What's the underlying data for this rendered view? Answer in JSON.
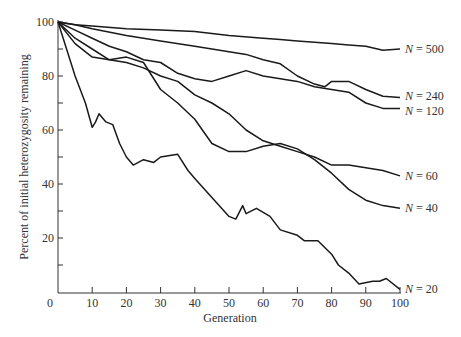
{
  "chart_data": {
    "type": "line",
    "title": "",
    "xlabel": "Generation",
    "ylabel": "Percent of initial heterozygosity remaining",
    "xlim": [
      0,
      100
    ],
    "ylim": [
      0,
      100
    ],
    "x_ticks": [
      0,
      10,
      20,
      30,
      40,
      50,
      60,
      70,
      80,
      90,
      100
    ],
    "y_ticks": [
      20,
      40,
      60,
      80,
      100
    ],
    "y_minor_ticks": [
      10,
      30,
      50,
      70,
      90
    ],
    "grid": false,
    "legend_position": "inline-right",
    "series": [
      {
        "name": "N = 500",
        "label": "N = 500",
        "x": [
          0,
          5,
          10,
          20,
          30,
          40,
          50,
          60,
          65,
          70,
          80,
          85,
          90,
          95,
          100
        ],
        "values": [
          100,
          99,
          98.5,
          97.5,
          97,
          96.5,
          95,
          94,
          93.5,
          93,
          92,
          91.5,
          91,
          89.5,
          90
        ]
      },
      {
        "name": "N = 240",
        "label": "N = 240",
        "x": [
          0,
          5,
          10,
          20,
          30,
          40,
          45,
          50,
          55,
          60,
          65,
          70,
          75,
          78,
          80,
          85,
          90,
          95,
          100
        ],
        "values": [
          100,
          99,
          97.5,
          95,
          93,
          91,
          90,
          89,
          88,
          86,
          84.5,
          80,
          77,
          76,
          78,
          78,
          75,
          72.5,
          72
        ]
      },
      {
        "name": "N = 120",
        "label": "N = 120",
        "x": [
          0,
          5,
          10,
          15,
          20,
          25,
          30,
          35,
          40,
          45,
          50,
          55,
          60,
          65,
          70,
          75,
          80,
          85,
          90,
          95,
          100
        ],
        "values": [
          100,
          97,
          94,
          91,
          89,
          86,
          85,
          81,
          79,
          78,
          80,
          82,
          80,
          79,
          78,
          76,
          75,
          74,
          70,
          68,
          68
        ]
      },
      {
        "name": "N = 60",
        "label": "N = 60",
        "x": [
          0,
          5,
          10,
          15,
          20,
          25,
          30,
          35,
          40,
          45,
          50,
          55,
          60,
          65,
          70,
          75,
          80,
          85,
          90,
          95,
          100
        ],
        "values": [
          100,
          92,
          87,
          86,
          85,
          83,
          80,
          78,
          73,
          70,
          66,
          60,
          56,
          54,
          52,
          50,
          47,
          47,
          46,
          45,
          43
        ]
      },
      {
        "name": "N = 40",
        "label": "N = 40",
        "x": [
          0,
          5,
          10,
          15,
          20,
          25,
          30,
          35,
          40,
          45,
          50,
          55,
          60,
          65,
          70,
          75,
          80,
          85,
          90,
          95,
          100
        ],
        "values": [
          100,
          94,
          90,
          86,
          87,
          85,
          75,
          70,
          64,
          55,
          52,
          52,
          54,
          55,
          53,
          49,
          44,
          38,
          34,
          32,
          31
        ]
      },
      {
        "name": "N = 20",
        "label": "N = 20",
        "x": [
          0,
          3,
          5,
          8,
          10,
          11,
          12,
          14,
          16,
          18,
          20,
          22,
          25,
          28,
          30,
          35,
          38,
          40,
          45,
          50,
          52,
          54,
          55,
          58,
          62,
          65,
          70,
          72,
          76,
          80,
          82,
          85,
          88,
          92,
          94,
          96,
          100
        ],
        "values": [
          100,
          88,
          80,
          70,
          61,
          63,
          66,
          63,
          62,
          55,
          50,
          47,
          49,
          48,
          50,
          51,
          45,
          42,
          35,
          28,
          27,
          32,
          29,
          31,
          28,
          23,
          21,
          19,
          19,
          14,
          10,
          7,
          3,
          4,
          4,
          5,
          1
        ]
      }
    ]
  }
}
